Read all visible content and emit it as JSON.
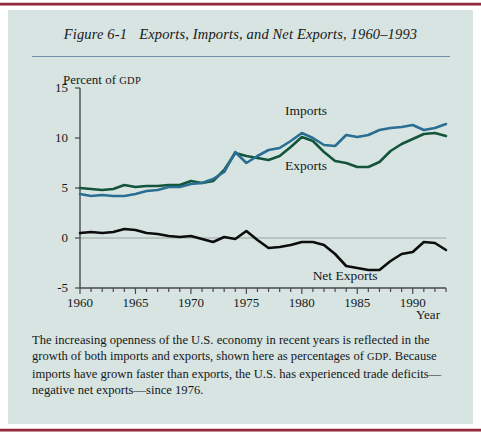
{
  "figure": {
    "number": "Figure 6-1",
    "title": "Exports, Imports, and Net Exports, 1960–1993",
    "caption_part1": "The increasing openness of the U.S. economy in recent years is reflected in the growth of both imports and exports, shown here as percentages of ",
    "caption_gdp": "GDP",
    "caption_part2": ". Because imports have grown faster than exports, the U.S. has experienced trade deficits—negative net exports—since 1976."
  },
  "colors": {
    "panel_background": "#d7e4e1",
    "rule": "#8f2a3c",
    "title_rule": "#6f92a6",
    "imports": "#2b6e93",
    "exports": "#13543a",
    "net_exports": "#0d0d0d",
    "axis": "#4a4a4a",
    "zero_line": "#9aa6a4"
  },
  "chart_data": {
    "type": "line",
    "title": "Exports, Imports, and Net Exports, 1960–1993",
    "xlabel": "Year",
    "ylabel": "Percent of GDP",
    "ylabel_prefix": "Percent of ",
    "ylabel_smallcaps": "GDP",
    "xlim": [
      1960,
      1993
    ],
    "ylim": [
      -5,
      15
    ],
    "yticks": [
      15,
      10,
      5,
      0,
      -5
    ],
    "ytick_labels": [
      "15",
      "10",
      "5",
      "0",
      "-5"
    ],
    "xticks": [
      1960,
      1965,
      1970,
      1975,
      1980,
      1985,
      1990
    ],
    "xtick_labels": [
      "1960",
      "1965",
      "1970",
      "1975",
      "1980",
      "1985",
      "1990"
    ],
    "minor_xtick_step": 1,
    "grid": false,
    "zero_line": true,
    "legend": "inline-labels",
    "x": [
      1960,
      1961,
      1962,
      1963,
      1964,
      1965,
      1966,
      1967,
      1968,
      1969,
      1970,
      1971,
      1972,
      1973,
      1974,
      1975,
      1976,
      1977,
      1978,
      1979,
      1980,
      1981,
      1982,
      1983,
      1984,
      1985,
      1986,
      1987,
      1988,
      1989,
      1990,
      1991,
      1992,
      1993
    ],
    "series": [
      {
        "name": "Imports",
        "color": "#2b6e93",
        "label_x": 1981.0,
        "label_y": 12.6,
        "values": [
          4.4,
          4.2,
          4.3,
          4.2,
          4.2,
          4.4,
          4.7,
          4.8,
          5.1,
          5.1,
          5.4,
          5.5,
          5.9,
          6.6,
          8.6,
          7.5,
          8.2,
          8.8,
          9.0,
          9.7,
          10.5,
          10.0,
          9.3,
          9.2,
          10.3,
          10.1,
          10.3,
          10.8,
          11.0,
          11.1,
          11.3,
          10.8,
          11.0,
          11.4
        ]
      },
      {
        "name": "Exports",
        "color": "#13543a",
        "label_x": 1981.0,
        "label_y": 7.1,
        "values": [
          5.0,
          4.9,
          4.8,
          4.9,
          5.3,
          5.1,
          5.2,
          5.2,
          5.3,
          5.3,
          5.7,
          5.5,
          5.7,
          6.8,
          8.5,
          8.2,
          8.0,
          7.8,
          8.2,
          9.1,
          10.1,
          9.7,
          8.6,
          7.7,
          7.5,
          7.1,
          7.1,
          7.6,
          8.7,
          9.4,
          9.9,
          10.4,
          10.5,
          10.2
        ]
      },
      {
        "name": "Net Exports",
        "color": "#0d0d0d",
        "label_x": 1983.5,
        "label_y": -3.9,
        "values": [
          0.5,
          0.6,
          0.5,
          0.6,
          0.9,
          0.8,
          0.5,
          0.4,
          0.2,
          0.1,
          0.2,
          -0.1,
          -0.4,
          0.1,
          -0.1,
          0.7,
          -0.2,
          -1.0,
          -0.9,
          -0.7,
          -0.4,
          -0.4,
          -0.7,
          -1.6,
          -2.8,
          -3.0,
          -3.2,
          -3.2,
          -2.3,
          -1.6,
          -1.4,
          -0.4,
          -0.5,
          -1.2
        ]
      }
    ]
  }
}
